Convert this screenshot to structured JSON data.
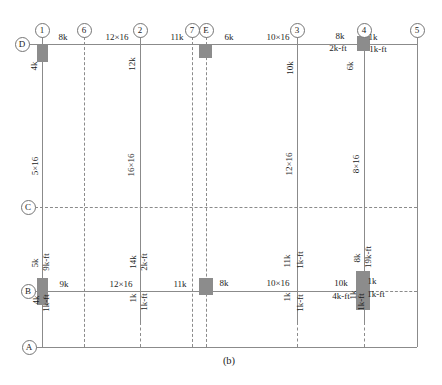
{
  "figure": {
    "caption": "(b)",
    "canvas": {
      "width": 442,
      "height": 385
    },
    "colors": {
      "background": "#ffffff",
      "line": "#8b8b8b",
      "column_fill": "#8c8c8c",
      "circle_border": "#757575",
      "text": "#1c1c1c"
    },
    "axis_circles": [
      {
        "id": "axis-1",
        "label": "1",
        "cx": 42,
        "cy": 30
      },
      {
        "id": "axis-6",
        "label": "6",
        "cx": 84,
        "cy": 30
      },
      {
        "id": "axis-2",
        "label": "2",
        "cx": 140,
        "cy": 30
      },
      {
        "id": "axis-7",
        "label": "7",
        "cx": 192,
        "cy": 30
      },
      {
        "id": "axis-E",
        "label": "E",
        "cx": 206,
        "cy": 30
      },
      {
        "id": "axis-3",
        "label": "3",
        "cx": 297,
        "cy": 30
      },
      {
        "id": "axis-4",
        "label": "4",
        "cx": 364,
        "cy": 30
      },
      {
        "id": "axis-5",
        "label": "5",
        "cx": 417,
        "cy": 30
      },
      {
        "id": "axis-D",
        "label": "D",
        "cx": 22,
        "cy": 44
      },
      {
        "id": "axis-C",
        "label": "C",
        "cx": 28,
        "cy": 207
      },
      {
        "id": "axis-B",
        "label": "B",
        "cx": 28,
        "cy": 291
      },
      {
        "id": "axis-A",
        "label": "A",
        "cx": 29,
        "cy": 347
      }
    ],
    "lines": [
      {
        "id": "grid-line-1",
        "x1": 42,
        "y1": 37,
        "x2": 42,
        "y2": 347,
        "style": "solid"
      },
      {
        "id": "grid-line-6",
        "x1": 84,
        "y1": 37,
        "x2": 84,
        "y2": 347,
        "style": "dashed"
      },
      {
        "id": "grid-line-2-beam",
        "x1": 140,
        "y1": 37,
        "x2": 140,
        "y2": 322,
        "style": "solid"
      },
      {
        "id": "grid-line-2-lower",
        "x1": 140,
        "y1": 322,
        "x2": 140,
        "y2": 347,
        "style": "dashed"
      },
      {
        "id": "grid-line-7",
        "x1": 192,
        "y1": 37,
        "x2": 192,
        "y2": 347,
        "style": "dashed"
      },
      {
        "id": "grid-line-E",
        "x1": 206,
        "y1": 37,
        "x2": 206,
        "y2": 347,
        "style": "dashed"
      },
      {
        "id": "grid-line-3-beam",
        "x1": 297,
        "y1": 37,
        "x2": 297,
        "y2": 322,
        "style": "solid"
      },
      {
        "id": "grid-line-3-lower",
        "x1": 297,
        "y1": 322,
        "x2": 297,
        "y2": 347,
        "style": "dashed"
      },
      {
        "id": "grid-line-4-beam",
        "x1": 364,
        "y1": 37,
        "x2": 364,
        "y2": 322,
        "style": "solid"
      },
      {
        "id": "grid-line-4-lower",
        "x1": 364,
        "y1": 322,
        "x2": 364,
        "y2": 347,
        "style": "dashed"
      },
      {
        "id": "grid-line-5",
        "x1": 417,
        "y1": 37,
        "x2": 417,
        "y2": 347,
        "style": "solid"
      },
      {
        "id": "beam-line-D",
        "x1": 29,
        "y1": 44,
        "x2": 417,
        "y2": 44,
        "style": "solid"
      },
      {
        "id": "grid-line-C",
        "x1": 35,
        "y1": 207,
        "x2": 417,
        "y2": 207,
        "style": "dashed"
      },
      {
        "id": "beam-line-B",
        "x1": 35,
        "y1": 291,
        "x2": 371,
        "y2": 291,
        "style": "solid"
      },
      {
        "id": "grid-line-B-right",
        "x1": 371,
        "y1": 291,
        "x2": 417,
        "y2": 291,
        "style": "dashed"
      },
      {
        "id": "grid-line-A",
        "x1": 36,
        "y1": 347,
        "x2": 417,
        "y2": 347,
        "style": "solid"
      }
    ],
    "columns": [
      {
        "id": "column-D1",
        "x": 37,
        "y": 44,
        "w": 11,
        "h": 18
      },
      {
        "id": "column-DE",
        "x": 199,
        "y": 44,
        "w": 13,
        "h": 14
      },
      {
        "id": "column-D4",
        "x": 357,
        "y": 36,
        "w": 13,
        "h": 15
      },
      {
        "id": "column-B1",
        "x": 37,
        "y": 278,
        "w": 11,
        "h": 27
      },
      {
        "id": "column-BE",
        "x": 199,
        "y": 278,
        "w": 14,
        "h": 17
      },
      {
        "id": "column-B4",
        "x": 356,
        "y": 271,
        "w": 14,
        "h": 39
      }
    ],
    "labels": [
      {
        "id": "d-load-8k",
        "text": "8k",
        "x": 63,
        "y": 37,
        "rot": false
      },
      {
        "id": "d-beam-12x16",
        "text": "12×16",
        "x": 117,
        "y": 37,
        "rot": false
      },
      {
        "id": "d-load-11k",
        "text": "11k",
        "x": 177,
        "y": 37,
        "rot": false
      },
      {
        "id": "d-load-6k",
        "text": "6k",
        "x": 229,
        "y": 37,
        "rot": false
      },
      {
        "id": "d-beam-10x16",
        "text": "10×16",
        "x": 278,
        "y": 37,
        "rot": false
      },
      {
        "id": "d4-load-8k",
        "text": "8k",
        "x": 340,
        "y": 36,
        "rot": false
      },
      {
        "id": "d4-moment-2kft",
        "text": "2k-ft",
        "x": 338,
        "y": 48,
        "rot": false
      },
      {
        "id": "d4-load-1k",
        "text": "1k",
        "x": 373,
        "y": 37,
        "rot": false
      },
      {
        "id": "d4-moment-1kft",
        "text": "1k-ft",
        "x": 378,
        "y": 49,
        "rot": false
      },
      {
        "id": "col1-load-4k",
        "text": "4k",
        "x": 34,
        "y": 66,
        "rot": true
      },
      {
        "id": "col2-load-12k",
        "text": "12k",
        "x": 132,
        "y": 64,
        "rot": true
      },
      {
        "id": "col3-load-10k",
        "text": "10k",
        "x": 290,
        "y": 68,
        "rot": true
      },
      {
        "id": "col4-load-6k",
        "text": "6k",
        "x": 350,
        "y": 66,
        "rot": true
      },
      {
        "id": "col1-size-5x16",
        "text": "5×16",
        "x": 35,
        "y": 166,
        "rot": true
      },
      {
        "id": "col2-size-16x16",
        "text": "16×16",
        "x": 131,
        "y": 165,
        "rot": true
      },
      {
        "id": "col3-size-12x16",
        "text": "12×16",
        "x": 289,
        "y": 164,
        "rot": true
      },
      {
        "id": "col4-size-8x16",
        "text": "8×16",
        "x": 356,
        "y": 164,
        "rot": true
      },
      {
        "id": "b1-load-5k",
        "text": "5k",
        "x": 35,
        "y": 263,
        "rot": true
      },
      {
        "id": "b1-moment-9kft",
        "text": "9k-ft",
        "x": 46,
        "y": 262,
        "rot": true
      },
      {
        "id": "b1-load-4k",
        "text": "4k",
        "x": 36,
        "y": 300,
        "rot": true
      },
      {
        "id": "b1-moment-1kft",
        "text": "1k-ft",
        "x": 46,
        "y": 303,
        "rot": true
      },
      {
        "id": "b2-load-14k",
        "text": "14k",
        "x": 133,
        "y": 262,
        "rot": true
      },
      {
        "id": "b2-moment-2kft",
        "text": "2k-ft",
        "x": 144,
        "y": 262,
        "rot": true
      },
      {
        "id": "b2-load-1k",
        "text": "1k",
        "x": 133,
        "y": 298,
        "rot": true
      },
      {
        "id": "b2-moment-1kft",
        "text": "1k-ft",
        "x": 144,
        "y": 302,
        "rot": true
      },
      {
        "id": "b3-load-11k",
        "text": "11k",
        "x": 287,
        "y": 261,
        "rot": true
      },
      {
        "id": "b3-moment-1kft-a",
        "text": "1k-ft",
        "x": 300,
        "y": 260,
        "rot": true
      },
      {
        "id": "b3-load-1k",
        "text": "1k",
        "x": 287,
        "y": 297,
        "rot": true
      },
      {
        "id": "b3-moment-1kft-b",
        "text": "1k-ft",
        "x": 300,
        "y": 303,
        "rot": true
      },
      {
        "id": "b4-load-8k",
        "text": "8k",
        "x": 357,
        "y": 258,
        "rot": true
      },
      {
        "id": "b4-moment-19kft",
        "text": "19k-ft",
        "x": 368,
        "y": 257,
        "rot": true
      },
      {
        "id": "b4-load-1k",
        "text": "1k",
        "x": 353,
        "y": 295,
        "rot": true
      },
      {
        "id": "b4-moment-1kft",
        "text": "1k-ft",
        "x": 361,
        "y": 302,
        "rot": true
      },
      {
        "id": "b-load-9k",
        "text": "9k",
        "x": 64,
        "y": 284,
        "rot": false
      },
      {
        "id": "b-beam-12x16",
        "text": "12×16",
        "x": 121,
        "y": 284,
        "rot": false
      },
      {
        "id": "b-load-11k",
        "text": "11k",
        "x": 180,
        "y": 284,
        "rot": false
      },
      {
        "id": "b-load-8k",
        "text": "8k",
        "x": 224,
        "y": 283,
        "rot": false
      },
      {
        "id": "b-beam-10x16",
        "text": "10×16",
        "x": 278,
        "y": 283,
        "rot": false
      },
      {
        "id": "b-load-10k",
        "text": "10k",
        "x": 341,
        "y": 283,
        "rot": false
      },
      {
        "id": "b-moment-4kft",
        "text": "4k-ft",
        "x": 341,
        "y": 296,
        "rot": false
      },
      {
        "id": "b-load-1k",
        "text": "1k",
        "x": 372,
        "y": 281,
        "rot": false
      },
      {
        "id": "b-moment-1kft",
        "text": "1k-ft",
        "x": 376,
        "y": 294,
        "rot": false
      }
    ]
  }
}
